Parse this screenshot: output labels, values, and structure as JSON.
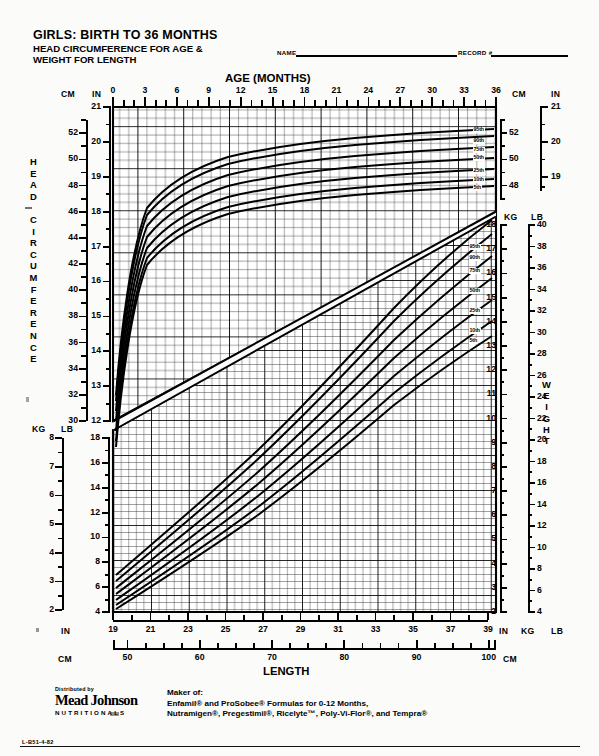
{
  "header": {
    "title_line1": "GIRLS: BIRTH TO 36 MONTHS",
    "title_line2": "HEAD CIRCUMFERENCE FOR AGE &",
    "title_line3": "WEIGHT FOR LENGTH",
    "name_label": "NAME",
    "name_value": "",
    "record_label": "RECORD #",
    "record_value": ""
  },
  "axes": {
    "age_title": "AGE (MONTHS)",
    "length_title": "LENGTH",
    "head_circumference_title": [
      "H",
      "E",
      "A",
      "D",
      " ",
      "C",
      "I",
      "R",
      "C",
      "U",
      "M",
      "F",
      "E",
      "R",
      "E",
      "N",
      "C",
      "E"
    ],
    "weight_title": [
      "W",
      "E",
      "I",
      "G",
      "H",
      "T"
    ],
    "unit_cm": "CM",
    "unit_in": "IN",
    "unit_kg": "KG",
    "unit_lb": "LB",
    "age_ticks": [
      0,
      3,
      6,
      9,
      12,
      15,
      18,
      21,
      24,
      27,
      30,
      33,
      36
    ],
    "age_minor_step": 1,
    "hc_cm_ticks": [
      52,
      50,
      48,
      46,
      44,
      42,
      40,
      38,
      36,
      34,
      32
    ],
    "hc_cm_range": [
      30,
      54
    ],
    "hc_in_ticks": [
      21,
      20,
      19,
      18,
      17,
      16,
      15,
      14,
      13,
      12
    ],
    "hc_in_range": [
      12,
      21
    ],
    "hc_right_cm_ticks": [
      52,
      50,
      48
    ],
    "hc_right_in_ticks": [
      21,
      20,
      19
    ],
    "length_in_ticks": [
      19,
      21,
      23,
      25,
      27,
      29,
      31,
      33,
      35,
      37,
      39
    ],
    "length_cm_ticks": [
      50,
      60,
      70,
      80,
      90,
      100
    ],
    "wt_left_kg_ticks": [
      8,
      7,
      6,
      5,
      4,
      3,
      2
    ],
    "wt_left_lb_ticks": [
      18,
      16,
      14,
      12,
      10,
      8,
      6,
      4
    ],
    "wt_right_kg_ticks": [
      18,
      17,
      16,
      15,
      14,
      13,
      12,
      11,
      10,
      9,
      8,
      7,
      6,
      5,
      4,
      3,
      2
    ],
    "wt_right_lb_ticks": [
      40,
      38,
      36,
      34,
      32,
      30,
      28,
      26,
      24,
      22,
      20,
      18,
      16,
      14,
      12,
      10,
      8,
      6,
      4
    ]
  },
  "percentiles": {
    "head_circumference": [
      "95th",
      "90th",
      "75th",
      "50th",
      "25th",
      "10th",
      "5th"
    ],
    "weight_for_length": [
      "95th",
      "90th",
      "75th",
      "50th",
      "25th",
      "10th",
      "5th"
    ]
  },
  "chart_data": {
    "type": "line",
    "grid": true,
    "legend_position": "right-inline",
    "charts": [
      {
        "name": "head-circumference-for-age",
        "xlabel": "AGE (MONTHS)",
        "ylabel": "HEAD CIRCUMFERENCE",
        "x": [
          0,
          3,
          6,
          9,
          12,
          15,
          18,
          21,
          24,
          27,
          30,
          33,
          36
        ],
        "xlim": [
          0,
          36
        ],
        "ylim_cm": [
          30,
          54
        ],
        "ylim_in": [
          12,
          21
        ],
        "yunits": [
          "CM",
          "IN"
        ],
        "series": [
          {
            "name": "95th",
            "unit": "cm",
            "values": [
              37.4,
              42.2,
              44.6,
              46.2,
              47.4,
              48.3,
              49.0,
              49.5,
              50.0,
              50.4,
              50.8,
              51.1,
              51.4
            ]
          },
          {
            "name": "90th",
            "unit": "cm",
            "values": [
              36.9,
              41.7,
              44.1,
              45.7,
              46.9,
              47.8,
              48.5,
              49.0,
              49.5,
              49.9,
              50.2,
              50.5,
              50.8
            ]
          },
          {
            "name": "75th",
            "unit": "cm",
            "values": [
              36.1,
              40.9,
              43.3,
              44.9,
              46.1,
              47.0,
              47.7,
              48.2,
              48.6,
              49.0,
              49.3,
              49.6,
              49.9
            ]
          },
          {
            "name": "50th",
            "unit": "cm",
            "values": [
              35.2,
              40.0,
              42.4,
              44.0,
              45.2,
              46.1,
              46.8,
              47.3,
              47.7,
              48.1,
              48.4,
              48.7,
              49.0
            ]
          },
          {
            "name": "25th",
            "unit": "cm",
            "values": [
              34.3,
              39.1,
              41.5,
              43.1,
              44.3,
              45.2,
              45.9,
              46.4,
              46.8,
              47.2,
              47.5,
              47.8,
              48.1
            ]
          },
          {
            "name": "10th",
            "unit": "cm",
            "values": [
              33.5,
              38.3,
              40.7,
              42.3,
              43.5,
              44.4,
              45.1,
              45.6,
              46.0,
              46.4,
              46.7,
              47.0,
              47.3
            ]
          },
          {
            "name": "5th",
            "unit": "cm",
            "values": [
              33.0,
              37.8,
              40.2,
              41.8,
              43.0,
              43.9,
              44.6,
              45.1,
              45.5,
              45.9,
              46.2,
              46.5,
              46.8
            ]
          }
        ]
      },
      {
        "name": "weight-for-length",
        "xlabel": "LENGTH",
        "ylabel": "WEIGHT",
        "xunits": [
          "IN",
          "CM"
        ],
        "xlim_in": [
          19,
          39
        ],
        "xlim_cm": [
          48,
          100
        ],
        "ylim_kg": [
          2,
          18
        ],
        "ylim_lb": [
          4,
          40
        ],
        "yunits": [
          "KG",
          "LB"
        ],
        "x_cm": [
          50,
          55,
          60,
          65,
          70,
          75,
          80,
          85,
          90,
          95,
          100
        ],
        "series": [
          {
            "name": "95th",
            "unit": "kg",
            "values": [
              4.1,
              5.3,
              6.9,
              8.4,
              9.9,
              11.4,
              13.0,
              14.7,
              16.5,
              18.4,
              20.4
            ]
          },
          {
            "name": "90th",
            "unit": "kg",
            "values": [
              3.9,
              5.0,
              6.5,
              8.0,
              9.4,
              10.9,
              12.4,
              14.0,
              15.7,
              17.5,
              19.4
            ]
          },
          {
            "name": "75th",
            "unit": "kg",
            "values": [
              3.6,
              4.7,
              6.1,
              7.4,
              8.8,
              10.1,
              11.6,
              13.1,
              14.7,
              16.3,
              18.1
            ]
          },
          {
            "name": "50th",
            "unit": "kg",
            "values": [
              3.3,
              4.3,
              5.6,
              6.9,
              8.1,
              9.4,
              10.7,
              12.1,
              13.6,
              15.1,
              16.7
            ]
          },
          {
            "name": "25th",
            "unit": "kg",
            "values": [
              3.0,
              3.9,
              5.1,
              6.3,
              7.5,
              8.7,
              9.9,
              11.2,
              12.6,
              14.0,
              15.5
            ]
          },
          {
            "name": "10th",
            "unit": "kg",
            "values": [
              2.8,
              3.6,
              4.7,
              5.8,
              6.9,
              8.1,
              9.2,
              10.4,
              11.7,
              13.0,
              14.4
            ]
          },
          {
            "name": "5th",
            "unit": "kg",
            "values": [
              2.6,
              3.4,
              4.5,
              5.5,
              6.6,
              7.7,
              8.8,
              10.0,
              11.2,
              12.5,
              13.8
            ]
          }
        ]
      }
    ]
  },
  "footer": {
    "distributed_by": "Distributed by",
    "logo_text": "Mead Johnson",
    "logo_sub": "NUTRITIONALS",
    "maker_label": "Maker of:",
    "maker_line1": "Enfamil® and ProSobee® Formulas for 0-12 Months,",
    "maker_line2": "Nutramigen®, Pregestimil®, Ricelyte™, Poly-Vi-Flor®, and Tempra®",
    "code": "L-B51-4-82"
  }
}
